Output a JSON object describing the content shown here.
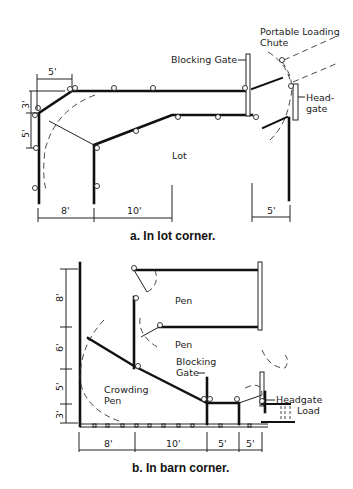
{
  "figure_a": {
    "caption": "a. In lot corner.",
    "labels": {
      "blocking_gate": "Blocking Gate",
      "portable_chute_line1": "Portable Loading",
      "portable_chute_line2": "Chute",
      "headgate_line1": "Head-",
      "headgate_line2": "gate",
      "lot": "Lot"
    },
    "dimensions": {
      "top": "5'",
      "left_upper": "3'",
      "left_lower": "5'",
      "bottom_1": "8'",
      "bottom_2": "10'",
      "bottom_right": "5'"
    }
  },
  "figure_b": {
    "caption": "b. In barn corner.",
    "labels": {
      "pen_1": "Pen",
      "pen_2": "Pen",
      "blocking_gate_line1": "Blocking",
      "blocking_gate_line2": "Gate",
      "crowding_pen_line1": "Crowding",
      "crowding_pen_line2": "Pen",
      "headgate": "Headgate",
      "load": "Load"
    },
    "dimensions": {
      "left_1": "8'",
      "left_2": "6'",
      "left_3": "5'",
      "left_4": "3'",
      "bottom_1": "8'",
      "bottom_2": "10'",
      "bottom_3": "5'",
      "bottom_4": "5'"
    }
  }
}
